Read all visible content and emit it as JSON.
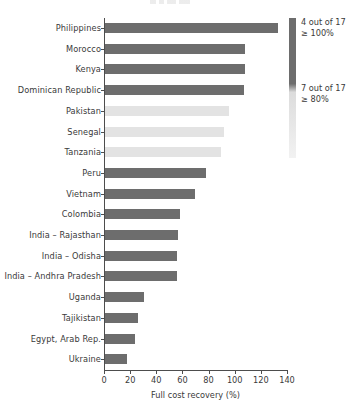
{
  "chart_data": {
    "type": "bar",
    "orientation": "horizontal",
    "title": "",
    "xlabel": "Full cost recovery (%)",
    "ylabel": "",
    "xlim": [
      0,
      140
    ],
    "xticks": [
      0,
      20,
      40,
      60,
      80,
      100,
      120,
      140
    ],
    "grid": false,
    "categories": [
      "Philippines",
      "Morocco",
      "Kenya",
      "Dominican Republic",
      "Pakistan",
      "Senegal",
      "Tanzania",
      "Peru",
      "Vietnam",
      "Colombia",
      "India – Rajasthan",
      "India – Odisha",
      "India – Andhra Pradesh",
      "Uganda",
      "Tajikistan",
      "Egypt, Arab Rep.",
      "Ukraine"
    ],
    "values": [
      132,
      107,
      107,
      106,
      95,
      91,
      89,
      77,
      69,
      57,
      56,
      55,
      55,
      30,
      25,
      23,
      17
    ],
    "bar_shades": [
      "dark",
      "dark",
      "dark",
      "dark",
      "light",
      "light",
      "light",
      "dark",
      "dark",
      "dark",
      "dark",
      "dark",
      "dark",
      "dark",
      "dark",
      "dark",
      "dark"
    ],
    "colors": {
      "bar_dark": "#6d6d6d",
      "bar_light": "#e3e3e3",
      "axis": "#4d4d4d",
      "text": "#3a3a3a"
    },
    "legend": {
      "position": "right",
      "type": "vertical-gradient-bar",
      "entries": [
        {
          "count_label": "4 out of 17",
          "threshold_label": "≥ 100%"
        },
        {
          "count_label": "7 out of 17",
          "threshold_label": "≥ 80%"
        }
      ]
    }
  }
}
